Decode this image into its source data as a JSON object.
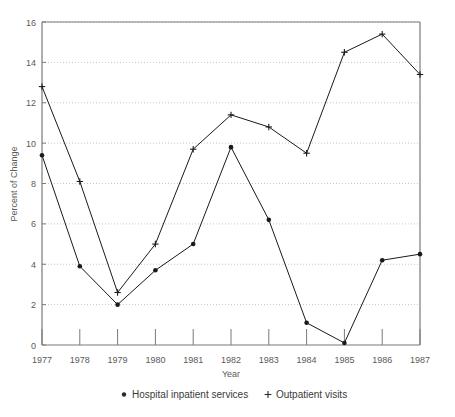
{
  "chart_data": {
    "type": "line",
    "title": "",
    "xlabel": "Year",
    "ylabel": "Percent of Change",
    "categories": [
      "1977",
      "1978",
      "1979",
      "1980",
      "1981",
      "1982",
      "1983",
      "1984",
      "1985",
      "1986",
      "1987"
    ],
    "x": [
      1977,
      1978,
      1979,
      1980,
      1981,
      1982,
      1983,
      1984,
      1985,
      1986,
      1987
    ],
    "xlim": [
      1977,
      1987
    ],
    "ylim": [
      0,
      16
    ],
    "yticks": [
      0,
      2,
      4,
      6,
      8,
      10,
      12,
      14,
      16
    ],
    "ytick_labels": [
      "0",
      "2",
      "4",
      "6",
      "8",
      "10",
      "12",
      "14",
      "16"
    ],
    "grid": "horizontal-dotted",
    "legend_position": "below-plot",
    "series": [
      {
        "name": "Hospital inpatient services",
        "marker": "dot",
        "marker_symbol": "•",
        "color": "#1a1a1a",
        "values": [
          9.4,
          3.9,
          2.0,
          3.7,
          5.0,
          9.8,
          6.2,
          1.1,
          0.1,
          4.2,
          4.5
        ]
      },
      {
        "name": "Outpatient visits",
        "marker": "plus",
        "marker_symbol": "+",
        "color": "#1a1a1a",
        "values": [
          12.8,
          8.1,
          2.6,
          5.0,
          9.7,
          11.4,
          10.8,
          9.5,
          14.5,
          15.4,
          13.4
        ]
      }
    ]
  },
  "legend": {
    "items": [
      {
        "symbol": "•",
        "label": "Hospital inpatient services"
      },
      {
        "symbol": "+",
        "label": "Outpatient visits"
      }
    ]
  },
  "axes": {
    "x_title": "Year",
    "y_title": "Percent of Change"
  },
  "style": {
    "frame_color": "#7a7a7a",
    "grid_color": "#c8c8c8",
    "line_color": "#2a2a2a",
    "text_color": "#5a5a5a",
    "background": "#ffffff"
  }
}
